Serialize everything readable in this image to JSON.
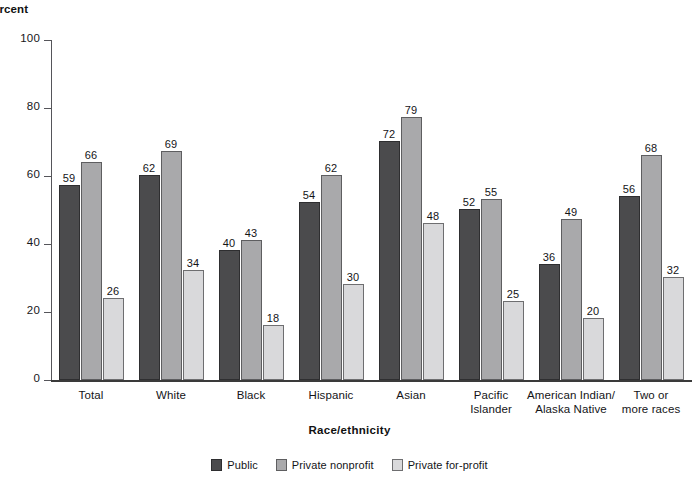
{
  "chart_data": {
    "type": "bar",
    "title": "",
    "xlabel": "Race/ethnicity",
    "ylabel": "ercent",
    "ylabel_full": "Percent",
    "ylim": [
      0,
      100
    ],
    "yticks": [
      0,
      20,
      40,
      60,
      80,
      100
    ],
    "grid": false,
    "legend_position": "bottom",
    "categories": [
      "Total",
      "White",
      "Black",
      "Hispanic",
      "Asian",
      "Pacific\nIslander",
      "American Indian/\nAlaska Native",
      "Two or\nmore races"
    ],
    "series": [
      {
        "name": "Public",
        "color": "#4b4b4d",
        "values": [
          59,
          62,
          40,
          54,
          72,
          52,
          36,
          56
        ]
      },
      {
        "name": "Private nonprofit",
        "color": "#a9a9ab",
        "values": [
          66,
          69,
          43,
          62,
          79,
          55,
          49,
          68
        ]
      },
      {
        "name": "Private for-profit",
        "color": "#d9d9db",
        "values": [
          26,
          34,
          18,
          30,
          48,
          25,
          20,
          32
        ]
      }
    ]
  }
}
